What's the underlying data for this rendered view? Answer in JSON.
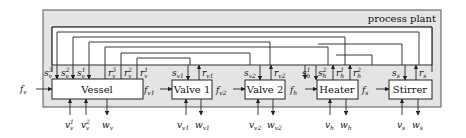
{
  "diagram": {
    "title": "process plant",
    "colors": {
      "plant_bg": "#e4e4e4",
      "plant_border": "#555555",
      "box_bg": "#ffffff",
      "line": "#222222"
    },
    "components": [
      {
        "id": "vessel",
        "label": "Vessel"
      },
      {
        "id": "valve1",
        "label": "Valve 1"
      },
      {
        "id": "valve2",
        "label": "Valve 2"
      },
      {
        "id": "heater",
        "label": "Heater"
      },
      {
        "id": "stirrer",
        "label": "Stirrer"
      }
    ],
    "flows": [
      {
        "base": "f",
        "sub": "v",
        "from": "input",
        "to": "vessel"
      },
      {
        "base": "f",
        "sub": "v1",
        "from": "vessel",
        "to": "valve1"
      },
      {
        "base": "f",
        "sub": "v2",
        "from": "valve1",
        "to": "valve2"
      },
      {
        "base": "f",
        "sub": "h",
        "from": "valve2",
        "to": "heater"
      },
      {
        "base": "f",
        "sub": "s",
        "from": "heater",
        "to": "stirrer"
      }
    ],
    "signals_in": [
      {
        "base": "s",
        "sub": "v",
        "sup": "3"
      },
      {
        "base": "s",
        "sub": "v",
        "sup": "2"
      },
      {
        "base": "s",
        "sub": "v",
        "sup": "1"
      },
      {
        "base": "s",
        "sub": "v1",
        "sup": ""
      },
      {
        "base": "s",
        "sub": "v2",
        "sup": ""
      },
      {
        "base": "s",
        "sub": "h",
        "sup": "1"
      },
      {
        "base": "s",
        "sub": "h",
        "sup": "2"
      },
      {
        "base": "s",
        "sub": "s",
        "sup": ""
      }
    ],
    "signals_out": [
      {
        "base": "r",
        "sub": "v",
        "sup": "3"
      },
      {
        "base": "r",
        "sub": "v",
        "sup": "2"
      },
      {
        "base": "r",
        "sub": "v",
        "sup": "1"
      },
      {
        "base": "r",
        "sub": "v1",
        "sup": ""
      },
      {
        "base": "r",
        "sub": "v2",
        "sup": ""
      },
      {
        "base": "r",
        "sub": "h",
        "sup": "1"
      },
      {
        "base": "r",
        "sub": "h",
        "sup": "2"
      },
      {
        "base": "r",
        "sub": "s",
        "sup": ""
      }
    ],
    "external_inputs": [
      {
        "base": "v",
        "sub": "v",
        "sup": "1"
      },
      {
        "base": "v",
        "sub": "v",
        "sup": "2"
      },
      {
        "base": "v",
        "sub": "v1",
        "sup": ""
      },
      {
        "base": "v",
        "sub": "v2",
        "sup": ""
      },
      {
        "base": "v",
        "sub": "h",
        "sup": ""
      },
      {
        "base": "v",
        "sub": "s",
        "sup": ""
      }
    ],
    "external_outputs": [
      {
        "base": "w",
        "sub": "v",
        "sup": ""
      },
      {
        "base": "w",
        "sub": "v1",
        "sup": ""
      },
      {
        "base": "w",
        "sub": "v2",
        "sup": ""
      },
      {
        "base": "w",
        "sub": "h",
        "sup": ""
      },
      {
        "base": "w",
        "sub": "s",
        "sup": ""
      }
    ]
  }
}
